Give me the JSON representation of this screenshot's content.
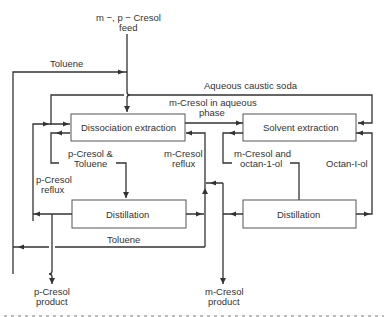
{
  "diagram": {
    "feed": {
      "line1_italic_a": "m",
      "line1_mid": " −, ",
      "line1_italic_b": "p",
      "line1_end": " − Cresol",
      "line2": "feed"
    },
    "units": {
      "dissociation_extraction": "Dissociation extraction",
      "solvent_extraction": "Solvent extraction",
      "distillation_left": "Distillation",
      "distillation_right": "Distillation"
    },
    "streams": {
      "toluene_top": "Toluene",
      "aqueous_caustic_soda": "Aqueous caustic soda",
      "m_cresol_aqueous_1_it": "m",
      "m_cresol_aqueous_1": "-Cresol in aqueous",
      "m_cresol_aqueous_2": "phase",
      "p_cresol_toluene_1_it": "p",
      "p_cresol_toluene_1": "-Cresol &",
      "p_cresol_toluene_2": "Toluene",
      "m_cresol_reflux_1_it": "m",
      "m_cresol_reflux_1": "-Cresol",
      "m_cresol_reflux_2": "reflux",
      "p_cresol_reflux_1_it": "p",
      "p_cresol_reflux_1": "-Cresol",
      "p_cresol_reflux_2": "reflux",
      "m_cresol_octanol_1_it": "m",
      "m_cresol_octanol_1": "-Cresol and",
      "m_cresol_octanol_2": "octan-1-ol",
      "octanol": "Octan-I-ol",
      "toluene_bottom": "Toluene"
    },
    "products": {
      "p_cresol_it": "p",
      "p_cresol_1": "-Cresol",
      "p_cresol_2": "product",
      "m_cresol_it": "m",
      "m_cresol_1": "-Cresol",
      "m_cresol_2": "product"
    }
  }
}
